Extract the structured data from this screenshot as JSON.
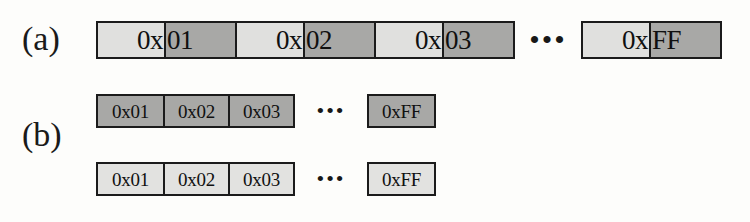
{
  "figure": {
    "type": "byte-sequence-diagram",
    "panels": [
      {
        "label": "(a)",
        "label_name": "panel-label-a",
        "rows": [
          {
            "style": "split-cell",
            "description": "contiguous byte cells, each value split across a light prefix half and a dark suffix half",
            "cells": [
              {
                "prefix": "0x",
                "suffix": "01"
              },
              {
                "prefix": "0x",
                "suffix": "02"
              },
              {
                "prefix": "0x",
                "suffix": "03"
              }
            ],
            "ellipsis": "•••",
            "tail_cell": {
              "prefix": "0x",
              "suffix": "FF"
            }
          }
        ]
      },
      {
        "label": "(b)",
        "label_name": "panel-label-b",
        "rows": [
          {
            "style": "plain-cell",
            "shade": "dark",
            "cells": [
              "0x01",
              "0x02",
              "0x03"
            ],
            "ellipsis": "•••",
            "tail_cell": "0xFF"
          },
          {
            "style": "plain-cell",
            "shade": "light",
            "cells": [
              "0x01",
              "0x02",
              "0x03"
            ],
            "ellipsis": "•••",
            "tail_cell": "0xFF"
          }
        ]
      }
    ]
  },
  "colors": {
    "background": "#fdfdfb",
    "border": "#1b1b1b",
    "text": "#101010",
    "shade_dark": "#a8a8a6",
    "shade_light": "#e2e2e0"
  }
}
